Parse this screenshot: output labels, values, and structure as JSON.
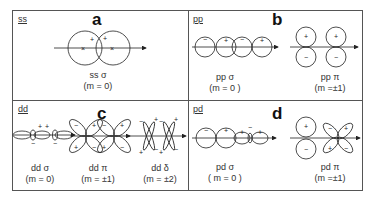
{
  "panels": {
    "a": {
      "tag": "ss",
      "letter": "a",
      "orbitals": [
        {
          "name": "ss σ",
          "m": "(m = 0)"
        }
      ]
    },
    "b": {
      "tag": "pp",
      "letter": "b",
      "orbitals": [
        {
          "name": "pp σ",
          "m": "(m = 0 )"
        },
        {
          "name": "pp π",
          "m": "(m =±1)"
        }
      ]
    },
    "c": {
      "tag": "dd",
      "letter": "c",
      "orbitals": [
        {
          "name": "dd σ",
          "m": "(m = 0)"
        },
        {
          "name": "dd π",
          "m": "(m = ±1)"
        },
        {
          "name": "dd δ",
          "m": "(m = ±2)"
        }
      ]
    },
    "d": {
      "tag": "pd",
      "letter": "d",
      "orbitals": [
        {
          "name": "pd σ",
          "m": "( m = 0 )"
        },
        {
          "name": "pd π",
          "m": "(m =±1)"
        }
      ]
    }
  },
  "signs": {
    "plus": "+",
    "minus": "−",
    "nucleus": "×"
  }
}
